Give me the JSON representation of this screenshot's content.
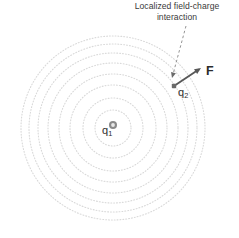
{
  "figure": {
    "caption": {
      "line1": "Localized field-charge",
      "line2": "interaction"
    },
    "labels": {
      "source_charge": "q",
      "source_charge_sub": "1",
      "test_charge": "q",
      "test_charge_sub": "2",
      "force_vector": "F"
    },
    "colors": {
      "field_lines": "#d9d9d9",
      "caption_text": "#3a3a3a",
      "label_text": "#2e2e2e",
      "arrow": "#555555",
      "leader_line": "#777777",
      "charge_marker": "#6e6e6e",
      "background": "#ffffff"
    }
  },
  "chart_data": {
    "type": "diagram",
    "title": "Localized field-charge interaction",
    "field_center": {
      "x": 113,
      "y": 128
    },
    "field_rings": {
      "count": 8,
      "radii": [
        18,
        30,
        43,
        54,
        65,
        75,
        84,
        92
      ],
      "style": "dotted",
      "color": "#d9d9d9"
    },
    "charges": [
      {
        "name": "q1",
        "label": "q",
        "subscript": "1",
        "x": 113,
        "y": 125,
        "marker": "ring",
        "role": "source-charge"
      },
      {
        "name": "q2",
        "label": "q",
        "subscript": "2",
        "x": 174,
        "y": 86,
        "marker": "square-dot",
        "role": "test-charge"
      }
    ],
    "vectors": [
      {
        "name": "F",
        "label": "F",
        "from": {
          "x": 174,
          "y": 86
        },
        "to": {
          "x": 201,
          "y": 68
        },
        "arrowhead": "end",
        "meaning": "force on q2 directed radially outward from q1"
      }
    ],
    "annotations": [
      {
        "text": "Localized field-charge interaction",
        "leader_from": {
          "x": 186,
          "y": 26
        },
        "leader_to": {
          "x": 172,
          "y": 78
        },
        "leader_style": "dashed",
        "arrowhead": "end"
      }
    ]
  }
}
